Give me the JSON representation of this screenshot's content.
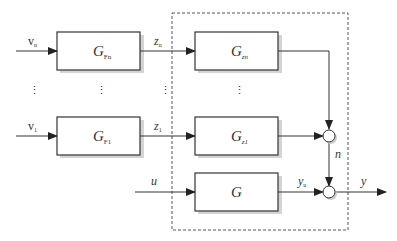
{
  "diagram": {
    "type": "block-diagram",
    "colors": {
      "line": "#333333",
      "dashed": "#555555",
      "shadow": "#cfcfcf",
      "background": "#ffffff"
    },
    "inputs": {
      "vn": {
        "main": "v",
        "sub": "n"
      },
      "v1": {
        "main": "v",
        "sub": "1"
      },
      "u": {
        "main": "u"
      }
    },
    "blocks": {
      "GFn": {
        "main": "G",
        "sub": "Fn"
      },
      "GF1": {
        "main": "G",
        "sub": "F1"
      },
      "Gzn": {
        "main": "G",
        "sub": "zn"
      },
      "Gz1": {
        "main": "G",
        "sub": "z1"
      },
      "G": {
        "main": "G"
      }
    },
    "signals": {
      "zn": {
        "main": "z",
        "sub": "n"
      },
      "z1": {
        "main": "z",
        "sub": "1"
      },
      "n": {
        "main": "n"
      },
      "yu": {
        "main": "y",
        "sub": "u"
      },
      "y": {
        "main": "y"
      }
    },
    "ellipsis": "⋮"
  }
}
